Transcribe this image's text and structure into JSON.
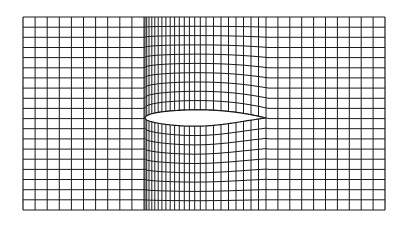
{
  "diagram": {
    "line_color": "#1a1a1a",
    "background": "#ffffff",
    "frame": {
      "left": 23,
      "right": 385,
      "top": 17,
      "bottom": 210
    },
    "rows": 19,
    "regions": [
      {
        "name": "upstream-uniform",
        "x_start": 23,
        "x_end": 144,
        "columns": 10
      },
      {
        "name": "leading-edge-clustered",
        "x_start": 144,
        "x_end": 206,
        "columns": 16
      },
      {
        "name": "airfoil-body",
        "x_start": 206,
        "x_end": 266,
        "columns": 8
      },
      {
        "name": "downstream-uniform",
        "x_start": 266,
        "x_end": 385,
        "columns": 10
      }
    ],
    "airfoil": {
      "leading_edge_x": 145,
      "trailing_edge_x": 266,
      "chord_line_y": 118,
      "max_upper_y": 103,
      "max_lower_y": 140
    }
  }
}
